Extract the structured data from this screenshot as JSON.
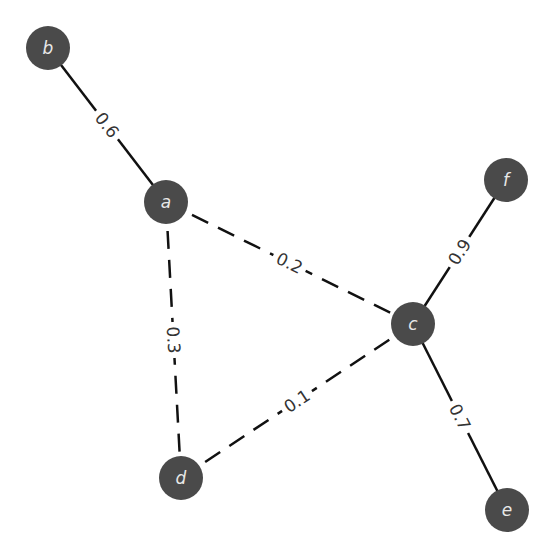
{
  "diagram": {
    "type": "weighted-graph",
    "nodes": [
      {
        "id": "b",
        "label": "b",
        "x": 48,
        "y": 48
      },
      {
        "id": "a",
        "label": "a",
        "x": 166,
        "y": 202
      },
      {
        "id": "f",
        "label": "f",
        "x": 506,
        "y": 180
      },
      {
        "id": "c",
        "label": "c",
        "x": 413,
        "y": 324
      },
      {
        "id": "d",
        "label": "d",
        "x": 181,
        "y": 478
      },
      {
        "id": "e",
        "label": "e",
        "x": 507,
        "y": 510
      }
    ],
    "edges": [
      {
        "from": "b",
        "to": "a",
        "weight": "0.6",
        "style": "solid"
      },
      {
        "from": "a",
        "to": "c",
        "weight": "0.2",
        "style": "dashed"
      },
      {
        "from": "a",
        "to": "d",
        "weight": "0.3",
        "style": "dashed"
      },
      {
        "from": "f",
        "to": "c",
        "weight": "0.9",
        "style": "solid"
      },
      {
        "from": "d",
        "to": "c",
        "weight": "0.1",
        "style": "dashed"
      },
      {
        "from": "c",
        "to": "e",
        "weight": "0.7",
        "style": "solid"
      }
    ],
    "colors": {
      "node_fill": "#4a4a4a",
      "node_text": "#e8e8e8",
      "edge": "#111111",
      "label": "#333333"
    }
  }
}
